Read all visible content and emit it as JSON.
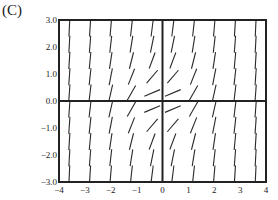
{
  "panel_label": "(C)",
  "chart_data": {
    "type": "slope-field",
    "title": "",
    "xlabel": "",
    "ylabel": "",
    "xlim": [
      -4,
      4
    ],
    "ylim": [
      -3.0,
      3.0
    ],
    "x_ticks": [
      "-4",
      "-3",
      "-2",
      "-1",
      "0",
      "1",
      "2",
      "3",
      "4"
    ],
    "y_ticks": [
      "3.0",
      "2.0",
      "1.0",
      "0.0",
      "-1.0",
      "-2.0",
      "-3.0"
    ],
    "grid": false,
    "grid_x": [
      -3.6,
      -2.8,
      -2.0,
      -1.2,
      -0.4,
      0.4,
      1.2,
      2.0,
      2.8,
      3.6
    ],
    "grid_y": [
      2.7,
      2.1,
      1.5,
      0.9,
      0.3,
      -0.3,
      -0.9,
      -1.5,
      -2.1,
      -2.7
    ],
    "slope_model": "dy/dx = x^2 + y^2 (approximate; all slopes positive, near-flat at origin)",
    "line_color": "#2a2a2a"
  }
}
